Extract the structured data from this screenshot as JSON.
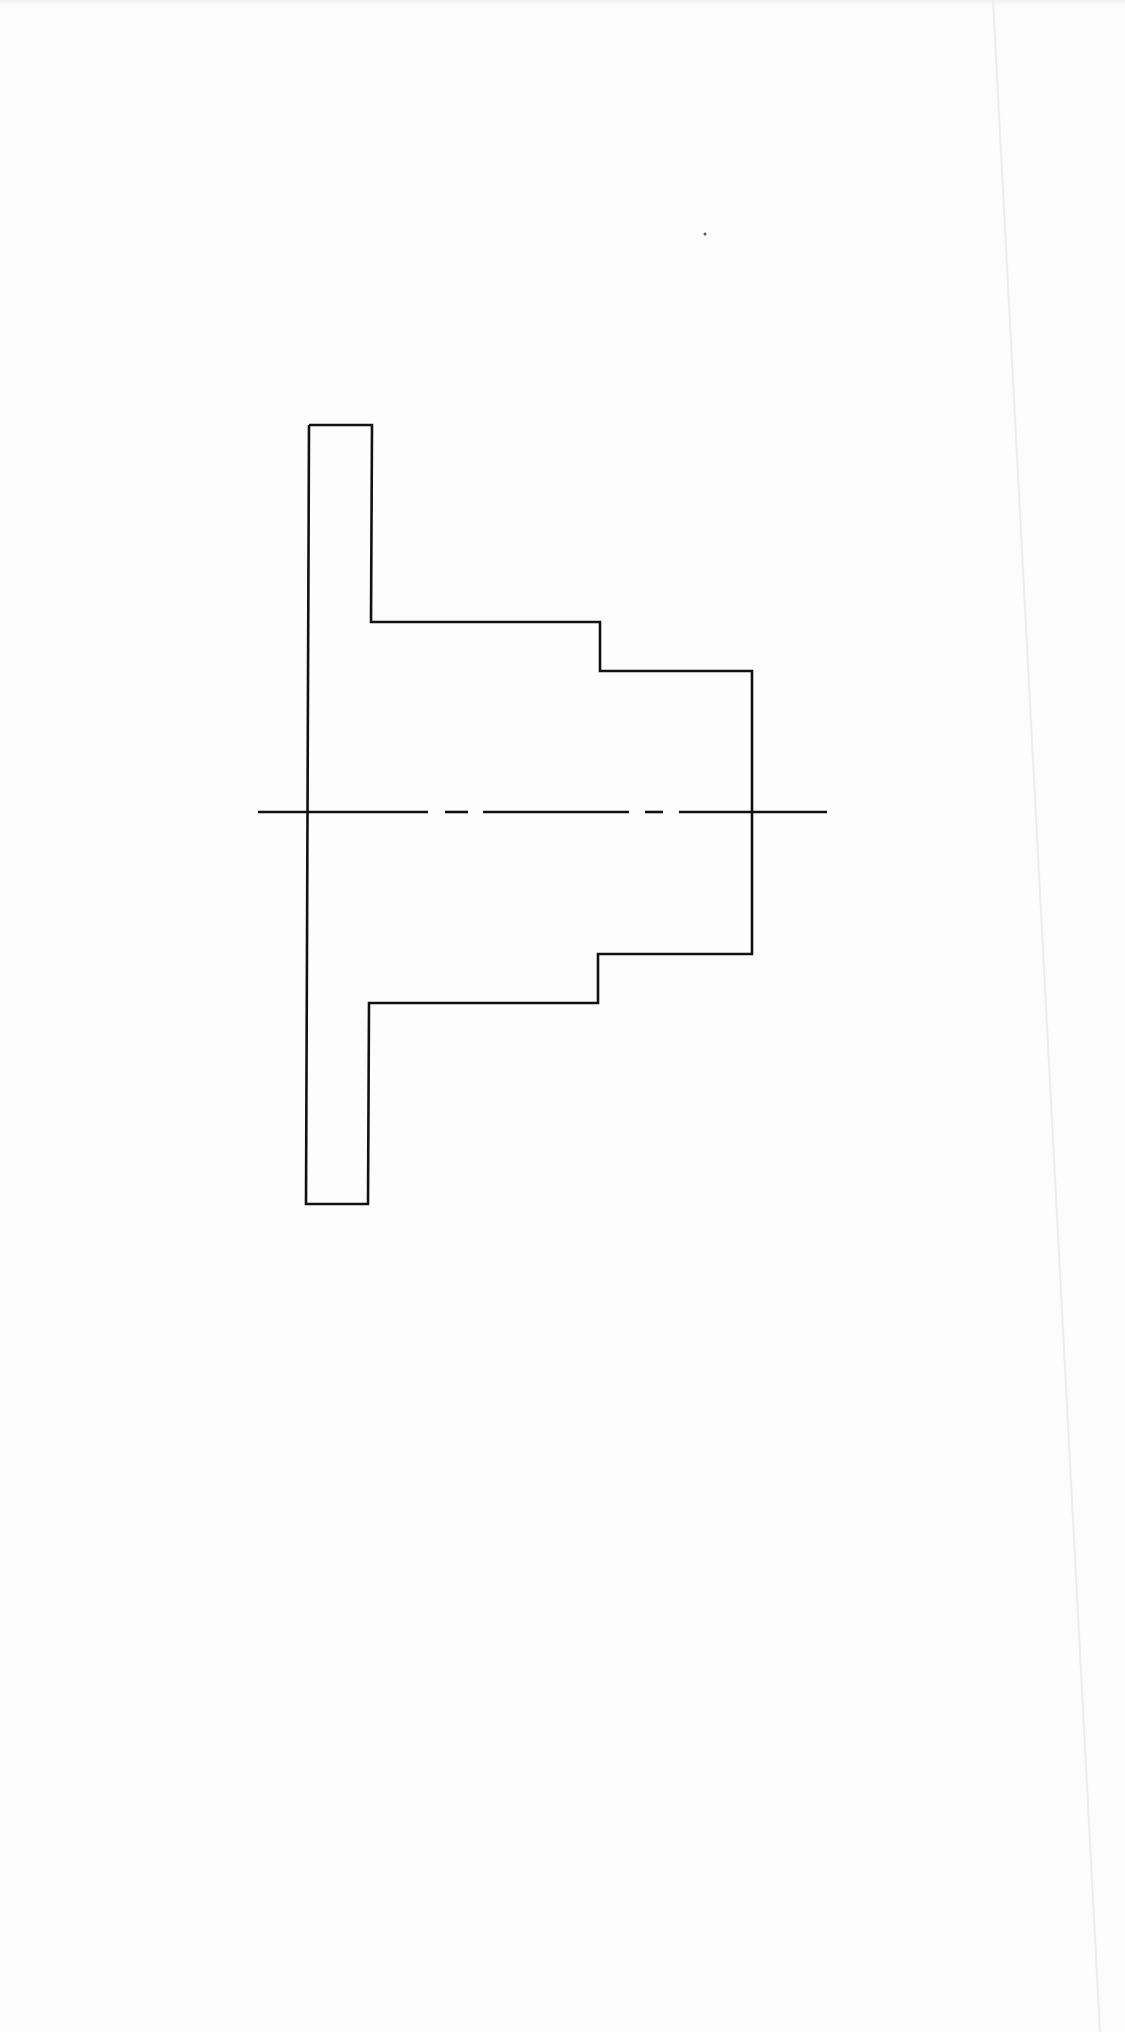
{
  "drawing": {
    "title": "Stepped flanged shaft – sectional outline",
    "type": "technical-drawing",
    "canvas": {
      "width": 1125,
      "height": 2032,
      "background": "#fdfdfd"
    },
    "stroke_color": "#111111",
    "stroke_width": 2.6,
    "outline_points": [
      [
        309,
        425
      ],
      [
        372,
        425
      ],
      [
        371,
        622
      ],
      [
        600,
        622
      ],
      [
        600,
        671
      ],
      [
        752,
        671
      ],
      [
        752,
        954
      ],
      [
        598,
        954
      ],
      [
        598,
        1003
      ],
      [
        369,
        1003
      ],
      [
        368,
        1204
      ],
      [
        306,
        1204
      ],
      [
        309,
        425
      ]
    ],
    "centerline": {
      "y": 812,
      "segments": [
        [
          258,
          428
        ],
        [
          445,
          468
        ],
        [
          483,
          629
        ],
        [
          645,
          663
        ],
        [
          679,
          827
        ]
      ],
      "style": "dash-dot"
    },
    "features": {
      "flange": {
        "x_left": 309,
        "x_right": 372,
        "y_top": 425,
        "y_bottom": 1204
      },
      "large_shaft": {
        "x_start": 371,
        "x_end": 600,
        "y_top": 622,
        "y_bottom": 1003
      },
      "small_shaft": {
        "x_start": 600,
        "x_end": 752,
        "y_top": 671,
        "y_bottom": 954
      }
    },
    "scan_artifacts": {
      "fold_line": {
        "x1": 993,
        "y1": 0,
        "x2": 1100,
        "y2": 2032,
        "color": "#ececec"
      },
      "speck": {
        "x": 705,
        "y": 234,
        "r": 1.5,
        "color": "#555555"
      }
    }
  }
}
